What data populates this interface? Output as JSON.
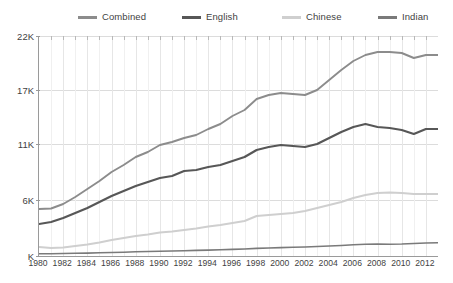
{
  "chart_data": {
    "type": "line",
    "title": "",
    "subtitle": "",
    "xlabel": "",
    "ylabel": "",
    "grid": true,
    "legend_position": "top",
    "xlim": [
      1980,
      2013
    ],
    "ylim": [
      0,
      22000
    ],
    "y_ticks": [
      22000,
      17000,
      11000,
      6000,
      0
    ],
    "y_tick_labels": [
      "22K",
      "17K",
      "11K",
      "6K",
      "K"
    ],
    "x_ticks": [
      1980,
      1982,
      1984,
      1986,
      1988,
      1990,
      1992,
      1994,
      1996,
      1998,
      2000,
      2002,
      2004,
      2006,
      2008,
      2010,
      2012
    ],
    "x_tick_labels": [
      "1980",
      "1982",
      "1984",
      "1986",
      "1988",
      "1990",
      "1992",
      "1994",
      "1996",
      "1998",
      "2000",
      "2002",
      "2004",
      "2006",
      "2008",
      "2010",
      "2012"
    ],
    "x": [
      1980,
      1981,
      1982,
      1983,
      1984,
      1985,
      1986,
      1987,
      1988,
      1989,
      1990,
      1991,
      1992,
      1993,
      1994,
      1995,
      1996,
      1997,
      1998,
      1999,
      2000,
      2001,
      2002,
      2003,
      2004,
      2005,
      2006,
      2007,
      2008,
      2009,
      2010,
      2011,
      2012,
      2013
    ],
    "series": [
      {
        "name": "Combined",
        "color": "#8c8c8c",
        "width": 1.9,
        "values": [
          4700,
          4750,
          5200,
          5900,
          6700,
          7500,
          8400,
          9100,
          9900,
          10400,
          11100,
          11400,
          11800,
          12100,
          12700,
          13200,
          14000,
          14600,
          15700,
          16100,
          16300,
          16200,
          16100,
          16600,
          17600,
          18600,
          19500,
          20100,
          20400,
          20400,
          20300,
          19800,
          20100,
          20100
        ]
      },
      {
        "name": "English",
        "color": "#575757",
        "width": 2.2,
        "values": [
          3200,
          3400,
          3800,
          4300,
          4800,
          5400,
          6000,
          6500,
          7000,
          7400,
          7800,
          8000,
          8500,
          8600,
          8900,
          9100,
          9500,
          9900,
          10600,
          10900,
          11100,
          11000,
          10900,
          11200,
          11800,
          12400,
          12900,
          13200,
          12900,
          12800,
          12600,
          12200,
          12700,
          12700
        ]
      },
      {
        "name": "Chinese",
        "color": "#cfcfcf",
        "width": 1.9,
        "values": [
          900,
          800,
          850,
          1000,
          1150,
          1350,
          1600,
          1800,
          2000,
          2150,
          2350,
          2450,
          2600,
          2750,
          2950,
          3100,
          3300,
          3500,
          4000,
          4100,
          4200,
          4300,
          4500,
          4800,
          5100,
          5400,
          5800,
          6100,
          6300,
          6350,
          6300,
          6200,
          6200,
          6200
        ]
      },
      {
        "name": "Indian",
        "color": "#7a7a7a",
        "width": 1.6,
        "values": [
          220,
          230,
          250,
          270,
          290,
          320,
          350,
          380,
          420,
          450,
          480,
          500,
          530,
          560,
          590,
          620,
          660,
          700,
          760,
          800,
          840,
          870,
          900,
          950,
          1000,
          1050,
          1120,
          1180,
          1200,
          1180,
          1200,
          1250,
          1300,
          1320
        ]
      }
    ]
  },
  "legend": {
    "items": [
      {
        "label": "Combined",
        "color": "#8c8c8c"
      },
      {
        "label": "English",
        "color": "#575757"
      },
      {
        "label": "Chinese",
        "color": "#cfcfcf"
      },
      {
        "label": "Indian",
        "color": "#7a7a7a"
      }
    ]
  }
}
